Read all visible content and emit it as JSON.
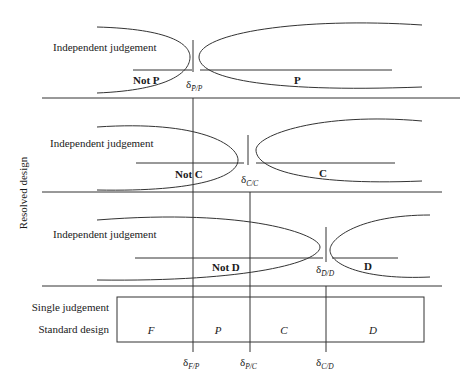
{
  "diagram": {
    "y_axis_label": "Resolved design",
    "panels": [
      {
        "id": "P",
        "left_title": "Independent judgement",
        "left_region_label": "Not P",
        "right_region_label": "P",
        "threshold_symbol": "δ",
        "threshold_subscript": "P̄/P"
      },
      {
        "id": "C",
        "left_title": "Independent judgement",
        "left_region_label": "Not C",
        "right_region_label": "C",
        "threshold_symbol": "δ",
        "threshold_subscript": "C̄/C"
      },
      {
        "id": "D",
        "left_title": "Independent judgement",
        "left_region_label": "Not D",
        "right_region_label": "D",
        "threshold_symbol": "δ",
        "threshold_subscript": "D̄/D"
      }
    ],
    "standard": {
      "row_label_1": "Single judgement",
      "row_label_2": "Standard design",
      "categories": [
        "F",
        "P",
        "C",
        "D"
      ],
      "thresholds": [
        {
          "symbol": "δ",
          "subscript": "F/P"
        },
        {
          "symbol": "δ",
          "subscript": "P/C"
        },
        {
          "symbol": "δ",
          "subscript": "C/D"
        }
      ]
    },
    "colors": {
      "line": "#333333",
      "text": "#1a1a1a",
      "background": "#ffffff"
    }
  }
}
